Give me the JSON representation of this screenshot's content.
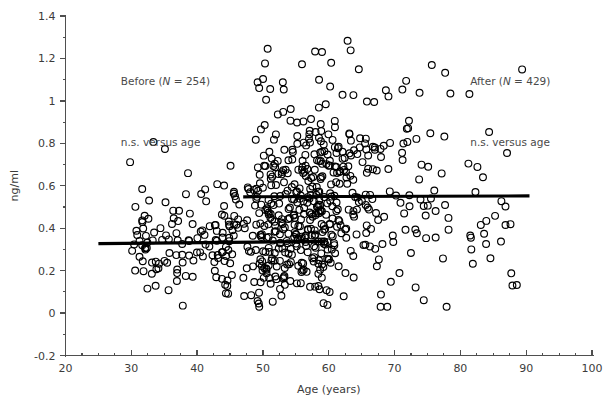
{
  "chart_data": {
    "type": "scatter",
    "title": "",
    "xlabel": "Age (years)",
    "ylabel": "ng/ml",
    "xlim": [
      20,
      100
    ],
    "ylim": [
      -0.2,
      1.4
    ],
    "xticks": [
      20,
      30,
      40,
      50,
      60,
      70,
      80,
      90,
      100
    ],
    "xtick_labels": [
      "20",
      "30",
      "40",
      "50",
      "60",
      "70",
      "80",
      "90",
      "100"
    ],
    "x_minor_step": 2.5,
    "yticks": [
      -0.2,
      0,
      0.2,
      0.4,
      0.6,
      0.8,
      1.0,
      1.2,
      1.4
    ],
    "ytick_labels": [
      "-0.2",
      "0",
      "0.2",
      "0.4",
      "0.6",
      "0.8",
      "1",
      "1.2",
      "1.4"
    ],
    "y_minor_step": 0.05,
    "grid": false,
    "legend": "none",
    "marker": "open-circle",
    "marker_radius": 3.4,
    "marker_color": "#000000",
    "series": [
      {
        "name": "Before",
        "n": 254,
        "x_range": [
          29,
          60
        ],
        "y_mean": 0.33,
        "y_sd": 0.14,
        "regression": {
          "x0": 25.0,
          "x1": 59.5,
          "y0": 0.327,
          "y1": 0.338,
          "slope": 0.00032
        }
      },
      {
        "name": "After",
        "n": 429,
        "x_range": [
          44,
          91
        ],
        "y_mean": 0.55,
        "y_sd": 0.24,
        "regression": {
          "x0": 47.0,
          "x1": 90.5,
          "y0": 0.548,
          "y1": 0.552,
          "slope": 9e-05
        }
      }
    ],
    "annotations": [
      {
        "id": "before-label",
        "text_plain": "Before (N = 254)",
        "x": 28.5,
        "y": 1.08
      },
      {
        "id": "before-stat",
        "text_plain": "n.s. versus age",
        "x": 28.5,
        "y": 0.79
      },
      {
        "id": "after-label",
        "text_plain": "After (N = 429)",
        "x": 82.0,
        "y": 1.08
      },
      {
        "id": "after-stat",
        "text_plain": "n.s. versus age",
        "x": 82.0,
        "y": 0.79
      }
    ]
  },
  "annotation_text": {
    "before_prefix": "Before (",
    "before_n_italic": "N",
    "before_suffix": " = 254)",
    "after_prefix": "After (",
    "after_n_italic": "N",
    "after_suffix": " = 429)",
    "ns_left": "n.s. versus age",
    "ns_right": "n.s. versus age"
  },
  "axis": {
    "x_title": "Age (years)",
    "y_title": "ng/ml"
  },
  "colors": {
    "marker_stroke": "#000000",
    "regression_line": "#000000",
    "axis": "#4f4f4f",
    "text": "#3b3b3b",
    "background": "#ffffff"
  }
}
